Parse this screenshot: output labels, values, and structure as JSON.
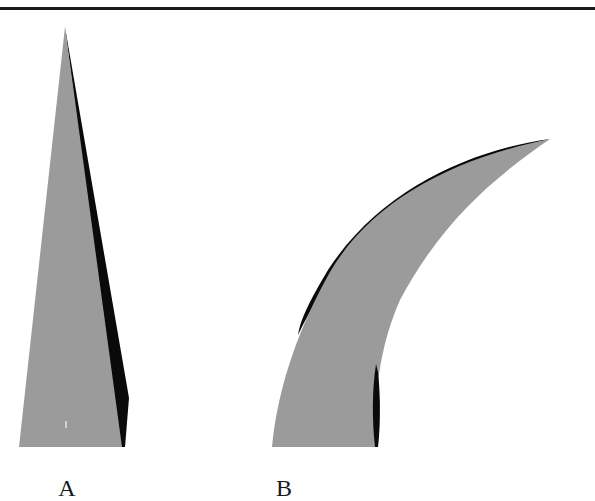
{
  "figure": {
    "colors": {
      "surface": "#9b9b9b",
      "shadow": "#0a0a0a",
      "rule": "#1a1a1a",
      "background": "#ffffff"
    },
    "panels": [
      {
        "id": "A",
        "label": "A",
        "shape": "straight-tapered-spike"
      },
      {
        "id": "B",
        "label": "B",
        "shape": "curved-tapered-horn"
      }
    ]
  }
}
